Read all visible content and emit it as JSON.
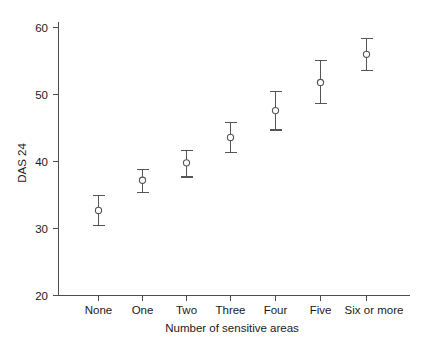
{
  "chart_data": {
    "type": "scatter",
    "title": "",
    "xlabel": "Number of sensitive areas",
    "ylabel": "DAS 24",
    "categories": [
      "None",
      "One",
      "Two",
      "Three",
      "Four",
      "Five",
      "Six or more"
    ],
    "values": [
      32.7,
      37.2,
      39.8,
      43.6,
      47.6,
      51.8,
      56.0
    ],
    "error_low": [
      30.5,
      35.4,
      37.7,
      41.4,
      44.7,
      48.7,
      53.6
    ],
    "error_high": [
      34.9,
      38.8,
      41.6,
      45.8,
      50.5,
      55.1,
      58.4
    ],
    "ylim": [
      20,
      60
    ],
    "yticks": [
      20,
      30,
      40,
      50,
      60
    ],
    "ytick_labels": [
      "20",
      "30",
      "40",
      "50",
      "60"
    ],
    "grid": false,
    "legend": "none",
    "marker": "open-circle",
    "error_style": "capped-vertical-bars",
    "colors": {
      "marker_stroke": "#555555",
      "marker_fill": "#ffffff",
      "errorbar": "#555555",
      "axis": "#4d4d4d",
      "text": "#1a1a1a",
      "background": "#ffffff"
    }
  }
}
